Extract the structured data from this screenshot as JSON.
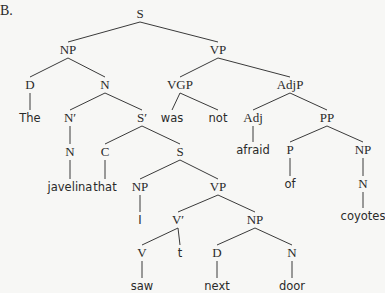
{
  "figure_label": "B.",
  "colors": {
    "background": "#f7f7f5",
    "ink": "#2a2a2a"
  },
  "nodes": [
    {
      "id": "S",
      "label": "S",
      "type": "cat",
      "x": 140,
      "y": 18
    },
    {
      "id": "NP1",
      "label": "NP",
      "type": "cat",
      "x": 68,
      "y": 54
    },
    {
      "id": "VP1",
      "label": "VP",
      "type": "cat",
      "x": 218,
      "y": 54
    },
    {
      "id": "D1",
      "label": "D",
      "type": "cat",
      "x": 30,
      "y": 89
    },
    {
      "id": "N1",
      "label": "N",
      "type": "cat",
      "x": 105,
      "y": 89
    },
    {
      "id": "VGP",
      "label": "VGP",
      "type": "cat",
      "x": 180,
      "y": 89
    },
    {
      "id": "AdjP",
      "label": "AdjP",
      "type": "cat",
      "x": 290,
      "y": 89
    },
    {
      "id": "The",
      "label": "The",
      "type": "word",
      "x": 30,
      "y": 122
    },
    {
      "id": "Nbar",
      "label": "N′",
      "type": "cat",
      "x": 70,
      "y": 122
    },
    {
      "id": "Sbar",
      "label": "S′",
      "type": "cat",
      "x": 142,
      "y": 122
    },
    {
      "id": "was",
      "label": "was",
      "type": "word",
      "x": 172,
      "y": 122
    },
    {
      "id": "not",
      "label": "not",
      "type": "word",
      "x": 218,
      "y": 122
    },
    {
      "id": "Adj",
      "label": "Adj",
      "type": "cat",
      "x": 253,
      "y": 122
    },
    {
      "id": "PP",
      "label": "PP",
      "type": "cat",
      "x": 327,
      "y": 122
    },
    {
      "id": "N2",
      "label": "N",
      "type": "cat",
      "x": 70,
      "y": 156
    },
    {
      "id": "C",
      "label": "C",
      "type": "cat",
      "x": 105,
      "y": 156
    },
    {
      "id": "S2",
      "label": "S",
      "type": "cat",
      "x": 180,
      "y": 156
    },
    {
      "id": "afraid",
      "label": "afraid",
      "type": "word",
      "x": 253,
      "y": 154
    },
    {
      "id": "P",
      "label": "P",
      "type": "cat",
      "x": 290,
      "y": 154
    },
    {
      "id": "NP2",
      "label": "NP",
      "type": "cat",
      "x": 363,
      "y": 154
    },
    {
      "id": "javelina",
      "label": "javelina",
      "type": "word",
      "x": 70,
      "y": 191
    },
    {
      "id": "that",
      "label": "that",
      "type": "word",
      "x": 105,
      "y": 191
    },
    {
      "id": "NP3",
      "label": "NP",
      "type": "cat",
      "x": 140,
      "y": 191
    },
    {
      "id": "VP2",
      "label": "VP",
      "type": "cat",
      "x": 218,
      "y": 191
    },
    {
      "id": "of",
      "label": "of",
      "type": "word",
      "x": 290,
      "y": 188
    },
    {
      "id": "N3",
      "label": "N",
      "type": "cat",
      "x": 363,
      "y": 188
    },
    {
      "id": "I",
      "label": "I",
      "type": "word",
      "x": 140,
      "y": 224
    },
    {
      "id": "Vbar",
      "label": "V′",
      "type": "cat",
      "x": 178,
      "y": 224
    },
    {
      "id": "NP4",
      "label": "NP",
      "type": "cat",
      "x": 255,
      "y": 224
    },
    {
      "id": "coyotes",
      "label": "coyotes",
      "type": "word",
      "x": 363,
      "y": 220
    },
    {
      "id": "V",
      "label": "V",
      "type": "cat",
      "x": 142,
      "y": 257
    },
    {
      "id": "t",
      "label": "t",
      "type": "word",
      "x": 180,
      "y": 257
    },
    {
      "id": "D2",
      "label": "D",
      "type": "cat",
      "x": 217,
      "y": 257
    },
    {
      "id": "N4",
      "label": "N",
      "type": "cat",
      "x": 292,
      "y": 257
    },
    {
      "id": "saw",
      "label": "saw",
      "type": "word",
      "x": 142,
      "y": 290
    },
    {
      "id": "next",
      "label": "next",
      "type": "word",
      "x": 217,
      "y": 290
    },
    {
      "id": "door",
      "label": "door",
      "type": "word",
      "x": 292,
      "y": 290
    }
  ],
  "edges": [
    [
      "S",
      "NP1"
    ],
    [
      "S",
      "VP1"
    ],
    [
      "NP1",
      "D1"
    ],
    [
      "NP1",
      "N1"
    ],
    [
      "VP1",
      "VGP"
    ],
    [
      "VP1",
      "AdjP"
    ],
    [
      "D1",
      "The"
    ],
    [
      "N1",
      "Nbar"
    ],
    [
      "N1",
      "Sbar"
    ],
    [
      "VGP",
      "was"
    ],
    [
      "VGP",
      "not"
    ],
    [
      "AdjP",
      "Adj"
    ],
    [
      "AdjP",
      "PP"
    ],
    [
      "Nbar",
      "N2"
    ],
    [
      "Sbar",
      "C"
    ],
    [
      "Sbar",
      "S2"
    ],
    [
      "Adj",
      "afraid"
    ],
    [
      "PP",
      "P"
    ],
    [
      "PP",
      "NP2"
    ],
    [
      "N2",
      "javelina"
    ],
    [
      "C",
      "that"
    ],
    [
      "S2",
      "NP3"
    ],
    [
      "S2",
      "VP2"
    ],
    [
      "P",
      "of"
    ],
    [
      "NP2",
      "N3"
    ],
    [
      "NP3",
      "I"
    ],
    [
      "VP2",
      "Vbar"
    ],
    [
      "VP2",
      "NP4"
    ],
    [
      "N3",
      "coyotes"
    ],
    [
      "Vbar",
      "V"
    ],
    [
      "Vbar",
      "t"
    ],
    [
      "NP4",
      "D2"
    ],
    [
      "NP4",
      "N4"
    ],
    [
      "V",
      "saw"
    ],
    [
      "D2",
      "next"
    ],
    [
      "N4",
      "door"
    ]
  ]
}
